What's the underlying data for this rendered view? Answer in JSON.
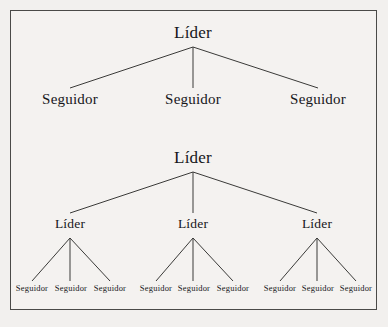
{
  "figure": {
    "label_leader": "Líder",
    "label_follower": "Seguidor",
    "colors": {
      "page_background": "#f2f0ee",
      "panel_background": "#f4f2f0",
      "border": "#4a4a48",
      "line": "#3a3a38",
      "text": "#16161a"
    }
  },
  "diagram_top": {
    "root": {
      "label": "Líder"
    },
    "children": [
      {
        "label": "Seguidor"
      },
      {
        "label": "Seguidor"
      },
      {
        "label": "Seguidor"
      }
    ]
  },
  "diagram_bottom": {
    "root": {
      "label": "Líder"
    },
    "branches": [
      {
        "label": "Líder",
        "children": [
          {
            "label": "Seguidor"
          },
          {
            "label": "Seguidor"
          },
          {
            "label": "Seguidor"
          }
        ]
      },
      {
        "label": "Líder",
        "children": [
          {
            "label": "Seguidor"
          },
          {
            "label": "Seguidor"
          },
          {
            "label": "Seguidor"
          }
        ]
      },
      {
        "label": "Líder",
        "children": [
          {
            "label": "Seguidor"
          },
          {
            "label": "Seguidor"
          },
          {
            "label": "Seguidor"
          }
        ]
      }
    ]
  }
}
